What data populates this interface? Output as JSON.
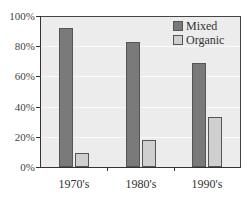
{
  "chart_data": {
    "type": "bar",
    "title": "",
    "xlabel": "",
    "ylabel": "",
    "categories": [
      "1970's",
      "1980's",
      "1990's"
    ],
    "series": [
      {
        "name": "Mixed",
        "values": [
          92,
          83,
          69
        ],
        "color": "#7a7a7a"
      },
      {
        "name": "Organic",
        "values": [
          9,
          18,
          33
        ],
        "color": "#cfcfcf"
      }
    ],
    "ylim": [
      0,
      100
    ],
    "yticks": [
      "0%",
      "20%",
      "40%",
      "60%",
      "80%",
      "100%"
    ],
    "grid": true,
    "legend_position": "upper right"
  },
  "legend": {
    "items": [
      {
        "label": "Mixed",
        "color": "#7a7a7a"
      },
      {
        "label": "Organic",
        "color": "#cfcfcf"
      }
    ]
  },
  "yaxis": {
    "ticks": [
      "0%",
      "20%",
      "40%",
      "60%",
      "80%",
      "100%"
    ]
  },
  "xaxis": {
    "labels": [
      "1970's",
      "1980's",
      "1990's"
    ]
  }
}
